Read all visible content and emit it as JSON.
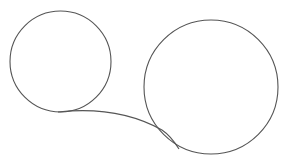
{
  "diagram": {
    "background": "#ffffff",
    "stroke_color": "#555555",
    "stroke_width": 1.1,
    "left_circle": {
      "cx": 60.5,
      "cy": 61.5,
      "r": 50.5
    },
    "right_circle": {
      "cx": 211,
      "cy": 87,
      "r": 67
    },
    "connector": {
      "d": "M 58 112 C 95 108, 130 112, 162 130 C 168 134, 174 141, 179 149"
    }
  }
}
